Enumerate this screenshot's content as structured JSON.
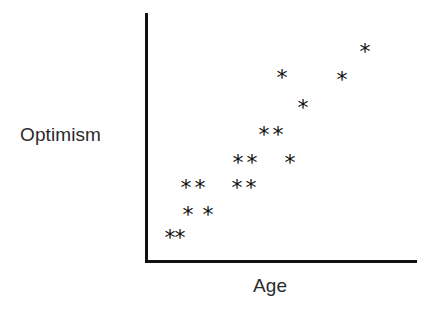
{
  "figure": {
    "width": 443,
    "height": 311,
    "background_color": "#ffffff",
    "axis_color": "#111111",
    "marker_color": "#111111",
    "marker_glyph": "★-asterisk"
  },
  "axes": {
    "y_label": "Optimism",
    "x_label": "Age",
    "y_axis_name": "vertical-axis-line",
    "x_axis_name": "horizontal-axis-line"
  },
  "chart_data": {
    "type": "scatter",
    "title": "",
    "subtitle": "",
    "xlabel": "Age",
    "ylabel": "Optimism",
    "xlim": [
      0,
      10
    ],
    "ylim": [
      0,
      10
    ],
    "grid": false,
    "legend": null,
    "axis_ticks": {
      "x": [],
      "y": []
    },
    "marker": "*",
    "marker_color": "#111111",
    "annotation": "Positive correlation between Age and Optimism",
    "series": [
      {
        "name": "respondents",
        "points": [
          {
            "x": 0.9,
            "y": 0.9,
            "px": 170,
            "py": 238
          },
          {
            "x": 1.25,
            "y": 0.9,
            "px": 180,
            "py": 238
          },
          {
            "x": 1.55,
            "y": 1.85,
            "px": 188,
            "py": 215
          },
          {
            "x": 2.3,
            "y": 1.85,
            "px": 208,
            "py": 215
          },
          {
            "x": 1.5,
            "y": 2.95,
            "px": 186,
            "py": 188
          },
          {
            "x": 2.0,
            "y": 2.95,
            "px": 200,
            "py": 188
          },
          {
            "x": 3.35,
            "y": 2.95,
            "px": 237,
            "py": 188
          },
          {
            "x": 3.85,
            "y": 2.95,
            "px": 251,
            "py": 188
          },
          {
            "x": 3.4,
            "y": 3.95,
            "px": 238,
            "py": 163
          },
          {
            "x": 3.9,
            "y": 3.95,
            "px": 252,
            "py": 163
          },
          {
            "x": 5.3,
            "y": 3.95,
            "px": 290,
            "py": 163
          },
          {
            "x": 4.35,
            "y": 5.05,
            "px": 264,
            "py": 135
          },
          {
            "x": 4.85,
            "y": 5.05,
            "px": 278,
            "py": 135
          },
          {
            "x": 5.8,
            "y": 6.15,
            "px": 303,
            "py": 108
          },
          {
            "x": 5.0,
            "y": 7.35,
            "px": 282,
            "py": 78
          },
          {
            "x": 7.2,
            "y": 7.25,
            "px": 342,
            "py": 80
          },
          {
            "x": 8.05,
            "y": 8.4,
            "px": 365,
            "py": 52
          }
        ]
      }
    ]
  }
}
